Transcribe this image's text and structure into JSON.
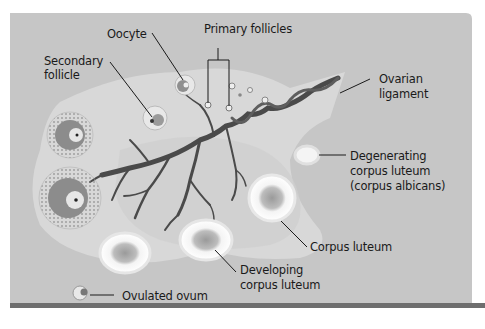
{
  "figure": {
    "colors": {
      "background_panel": "#c6c6c6",
      "ovary": "#dadada",
      "stroma_dark": "#cfcfcf",
      "vessel": "#4a4a4a",
      "bottom_bar": "#6e6e6e",
      "text": "#1a1a1a"
    }
  },
  "labels": {
    "oocyte": "Oocyte",
    "primary_follicles": "Primary follicles",
    "secondary_follicle_line1": "Secondary",
    "secondary_follicle_line2": "follicle",
    "ovarian_ligament_line1": "Ovarian",
    "ovarian_ligament_line2": "ligament",
    "degenerating_line1": "Degenerating",
    "degenerating_line2": "corpus luteum",
    "degenerating_line3": "(corpus albicans)",
    "corpus_luteum": "Corpus luteum",
    "developing_line1": "Developing",
    "developing_line2": "corpus luteum",
    "ovulated_ovum": "Ovulated ovum"
  }
}
